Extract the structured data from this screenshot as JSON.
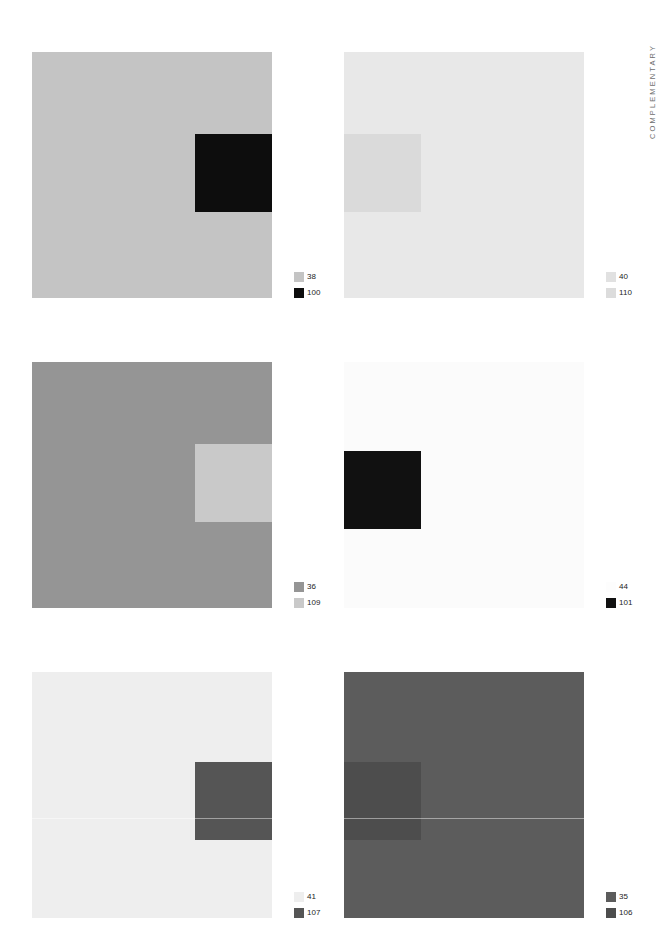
{
  "page": {
    "side_label": "COMPLEMENTARY",
    "background": "#ffffff"
  },
  "plates": [
    {
      "id": "plate-1",
      "row": 1,
      "column": 1,
      "field_color": "#c4c4c4",
      "patch_color": "#0d0d0d",
      "patch_position": "right",
      "seam": false,
      "legend": [
        {
          "swatch": "#c4c4c4",
          "label": "38"
        },
        {
          "swatch": "#0d0d0d",
          "label": "100"
        }
      ]
    },
    {
      "id": "plate-2",
      "row": 1,
      "column": 2,
      "field_color": "#e8e8e8",
      "patch_color": "#dadada",
      "patch_position": "left",
      "seam": false,
      "legend": [
        {
          "swatch": "#e1e1e1",
          "label": "40"
        },
        {
          "swatch": "#dcdcdc",
          "label": "110"
        }
      ]
    },
    {
      "id": "plate-3",
      "row": 2,
      "column": 1,
      "field_color": "#959595",
      "patch_color": "#c9c9c9",
      "patch_position": "right",
      "seam": false,
      "legend": [
        {
          "swatch": "#959595",
          "label": "36"
        },
        {
          "swatch": "#c9c9c9",
          "label": "109"
        }
      ]
    },
    {
      "id": "plate-4",
      "row": 2,
      "column": 2,
      "field_color": "#fbfbfb",
      "patch_color": "#111111",
      "patch_position": "inset",
      "seam": false,
      "legend": [
        {
          "swatch": "#fdfdfd",
          "label": "44"
        },
        {
          "swatch": "#111111",
          "label": "101"
        }
      ]
    },
    {
      "id": "plate-5",
      "row": 3,
      "column": 1,
      "field_color": "#eeeeee",
      "patch_color": "#555555",
      "patch_position": "right-low",
      "seam": true,
      "legend": [
        {
          "swatch": "#eeeeee",
          "label": "41"
        },
        {
          "swatch": "#555555",
          "label": "107"
        }
      ]
    },
    {
      "id": "plate-6",
      "row": 3,
      "column": 2,
      "field_color": "#5c5c5c",
      "patch_color": "#4d4d4d",
      "patch_position": "left-low",
      "seam": true,
      "legend": [
        {
          "swatch": "#5c5c5c",
          "label": "35"
        },
        {
          "swatch": "#4d4d4d",
          "label": "106"
        }
      ]
    }
  ],
  "chart_data": {
    "type": "table",
    "title": "COMPLEMENTARY",
    "columns": [
      "plate",
      "row",
      "column",
      "ground_number",
      "patch_number",
      "ground_color",
      "patch_color"
    ],
    "rows": [
      [
        "plate-1",
        1,
        1,
        "38",
        "100",
        "#c4c4c4",
        "#0d0d0d"
      ],
      [
        "plate-2",
        1,
        2,
        "40",
        "110",
        "#e8e8e8",
        "#dadada"
      ],
      [
        "plate-3",
        2,
        1,
        "36",
        "109",
        "#959595",
        "#c9c9c9"
      ],
      [
        "plate-4",
        2,
        2,
        "44",
        "101",
        "#fbfbfb",
        "#111111"
      ],
      [
        "plate-5",
        3,
        1,
        "41",
        "107",
        "#eeeeee",
        "#555555"
      ],
      [
        "plate-6",
        3,
        2,
        "35",
        "106",
        "#5c5c5c",
        "#4d4d4d"
      ]
    ]
  }
}
